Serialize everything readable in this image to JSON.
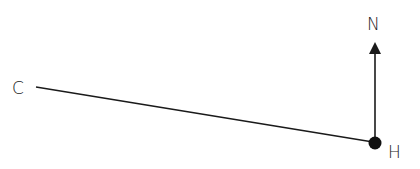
{
  "diagram": {
    "points": [
      {
        "id": "C",
        "label": "C"
      },
      {
        "id": "H",
        "label": "H"
      }
    ],
    "north_label": "N",
    "colors": {
      "ink": "#1a1a1a",
      "background": "#ffffff"
    }
  }
}
